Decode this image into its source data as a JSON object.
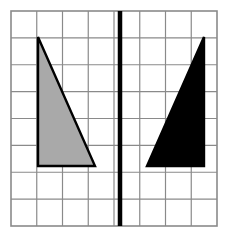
{
  "figure": {
    "title": "Reflection of a right triangle across a vertical mirror line",
    "canvas": {
      "width": 228,
      "height": 236,
      "background": "#ffffff"
    },
    "grid": {
      "label": "square grid",
      "columns": 8,
      "rows": 8,
      "x0": 11,
      "y0": 11,
      "x1": 217,
      "y1": 226,
      "cell_width": 25.75,
      "cell_height": 26.875,
      "line_color": "#8a8a8a",
      "line_width": 1.2,
      "border_color": "#8a8a8a",
      "border_width": 1.6
    },
    "mirror_line": {
      "label": "line of reflection",
      "orientation": "vertical",
      "x": 120,
      "y_top": 11,
      "y_bottom": 226,
      "color": "#000000",
      "width": 4.5
    },
    "shapes": [
      {
        "name": "pre-image triangle",
        "id": "gray-triangle",
        "side": "left",
        "fill": "#a9a9a9",
        "stroke": "#000000",
        "stroke_width": 2.4,
        "points": "38,37 38,166 95,166",
        "vertices": [
          {
            "label": "apex",
            "x": 38,
            "y": 37
          },
          {
            "label": "bottom-left right angle",
            "x": 38,
            "y": 166
          },
          {
            "label": "bottom-right",
            "x": 95,
            "y": 166
          }
        ]
      },
      {
        "name": "image triangle",
        "id": "black-triangle",
        "side": "right",
        "fill": "#000000",
        "stroke": "#000000",
        "stroke_width": 2.4,
        "points": "204,37 204,166 147,166",
        "vertices": [
          {
            "label": "apex",
            "x": 204,
            "y": 37
          },
          {
            "label": "bottom-right right angle",
            "x": 204,
            "y": 166
          },
          {
            "label": "bottom-left",
            "x": 147,
            "y": 166
          }
        ]
      }
    ]
  }
}
